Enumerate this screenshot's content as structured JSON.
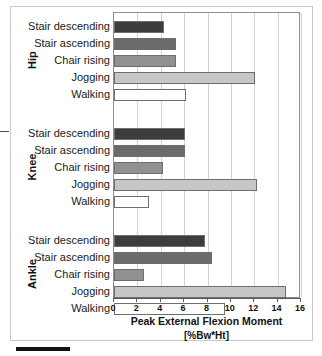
{
  "figure": {
    "x_axis_title": "Peak External Flexion Moment",
    "x_axis_units": "[%Bw*Ht]"
  },
  "groups": [
    {
      "name": "Hip"
    },
    {
      "name": "Knee"
    },
    {
      "name": "Ankle"
    }
  ],
  "labels": {
    "stair_descending": "Stair descending",
    "stair_ascending": "Stair ascending",
    "chair_rising": "Chair rising",
    "jogging": "Jogging",
    "walking": "Walking"
  },
  "ticks": [
    "0",
    "2",
    "4",
    "6",
    "8",
    "10",
    "12",
    "14",
    "16"
  ],
  "colors": {
    "stair_descending": "#3d3d3d",
    "stair_ascending": "#6b6b6b",
    "chair_rising": "#909090",
    "jogging": "#c6c6c6",
    "walking": "#ffffff",
    "bar_outline": "#6e6e6e",
    "gridline": "#d2d2d2",
    "axis": "#5a5a5a"
  },
  "chart_data": {
    "type": "bar",
    "orientation": "horizontal",
    "title": "",
    "xlabel": "Peak External Flexion Moment [%Bw*Ht]",
    "ylabel": "",
    "xlim": [
      0,
      16
    ],
    "xticks": [
      0,
      2,
      4,
      6,
      8,
      10,
      12,
      14,
      16
    ],
    "grid": true,
    "legend": "none",
    "categories": [
      "Stair descending",
      "Stair ascending",
      "Chair rising",
      "Jogging",
      "Walking"
    ],
    "groups": [
      "Hip",
      "Knee",
      "Ankle"
    ],
    "series": [
      {
        "name": "Hip",
        "categories": [
          "Stair descending",
          "Stair ascending",
          "Chair rising",
          "Jogging",
          "Walking"
        ],
        "values": [
          4.3,
          5.3,
          5.3,
          12.1,
          6.2
        ]
      },
      {
        "name": "Knee",
        "categories": [
          "Stair descending",
          "Stair ascending",
          "Chair rising",
          "Jogging",
          "Walking"
        ],
        "values": [
          6.1,
          6.1,
          4.2,
          12.2,
          3.0
        ]
      },
      {
        "name": "Ankle",
        "categories": [
          "Stair descending",
          "Stair ascending",
          "Chair rising",
          "Jogging",
          "Walking"
        ],
        "values": [
          7.8,
          8.4,
          2.6,
          14.7,
          9.5
        ]
      }
    ]
  }
}
